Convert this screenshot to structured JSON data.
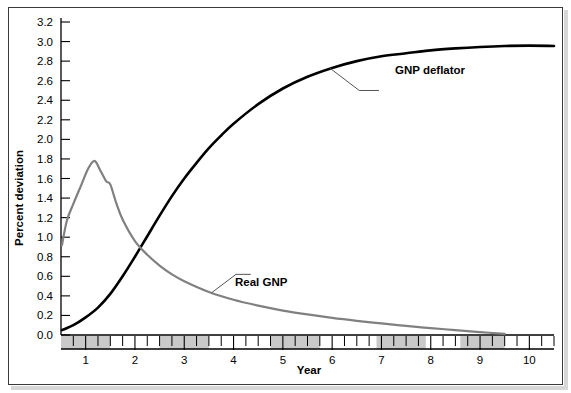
{
  "figure": {
    "background_color": "#ffffff",
    "frame_color": "#3a3a3a"
  },
  "axes": {
    "y_title": "Percent deviation",
    "x_title": "Year",
    "y_ticks": [
      "0.0",
      "0.2",
      "0.4",
      "0.6",
      "0.8",
      "1.0",
      "1.2",
      "1.4",
      "1.6",
      "1.8",
      "2.0",
      "2.2",
      "2.4",
      "2.6",
      "2.8",
      "3.0",
      "3.2"
    ],
    "x_ticks": [
      "1",
      "2",
      "3",
      "4",
      "5",
      "6",
      "7",
      "8",
      "9",
      "10"
    ]
  },
  "annotations": {
    "deflator_label": "GNP deflator",
    "real_gnp_label": "Real GNP"
  },
  "chart_data": {
    "type": "line",
    "title": "",
    "xlabel": "Year",
    "ylabel": "Percent deviation",
    "xlim": [
      0.5,
      10.5
    ],
    "ylim": [
      0.0,
      3.2
    ],
    "xtick_step": 1,
    "xtick_minor_step": 0.25,
    "ytick_step": 0.2,
    "grid": false,
    "legend_position": "inline-annotations",
    "shaded_bands": [
      {
        "start": 0.5,
        "end": 1.5
      },
      {
        "start": 2.5,
        "end": 3.5
      },
      {
        "start": 4.75,
        "end": 5.75
      },
      {
        "start": 6.9,
        "end": 7.9
      },
      {
        "start": 8.6,
        "end": 9.5
      }
    ],
    "series": [
      {
        "name": "GNP deflator",
        "color": "#000000",
        "width": 2.6,
        "x": [
          0.52,
          0.75,
          1.0,
          1.25,
          1.5,
          1.75,
          2.0,
          2.25,
          2.5,
          2.75,
          3.0,
          3.25,
          3.5,
          3.75,
          4.0,
          4.5,
          5.0,
          5.5,
          6.0,
          6.5,
          7.0,
          7.5,
          8.0,
          8.5,
          9.0,
          9.5,
          10.0,
          10.5
        ],
        "y": [
          0.05,
          0.1,
          0.18,
          0.28,
          0.42,
          0.6,
          0.8,
          1.01,
          1.22,
          1.42,
          1.6,
          1.76,
          1.91,
          2.04,
          2.16,
          2.36,
          2.52,
          2.64,
          2.73,
          2.8,
          2.85,
          2.88,
          2.91,
          2.93,
          2.945,
          2.955,
          2.958,
          2.955
        ]
      },
      {
        "name": "Real GNP",
        "color": "#808080",
        "width": 2.2,
        "x": [
          0.52,
          0.62,
          0.75,
          0.9,
          1.05,
          1.18,
          1.3,
          1.42,
          1.5,
          1.62,
          1.75,
          2.0,
          2.25,
          2.5,
          2.75,
          3.0,
          3.5,
          4.0,
          4.5,
          5.0,
          5.5,
          6.0,
          6.5,
          7.0,
          7.5,
          8.0,
          8.5,
          9.0,
          9.5
        ],
        "y": [
          0.92,
          1.17,
          1.34,
          1.52,
          1.7,
          1.78,
          1.68,
          1.57,
          1.54,
          1.35,
          1.18,
          0.96,
          0.82,
          0.71,
          0.62,
          0.55,
          0.44,
          0.36,
          0.3,
          0.25,
          0.21,
          0.175,
          0.145,
          0.118,
          0.093,
          0.07,
          0.05,
          0.03,
          0.012
        ]
      }
    ]
  }
}
